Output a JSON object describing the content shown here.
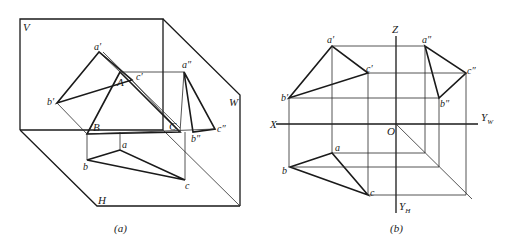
{
  "panel_a": {
    "caption": "(a)",
    "planes": {
      "V": "V",
      "W": "W",
      "H": "H"
    },
    "points": {
      "a_prime": "a′",
      "b_prime": "b′",
      "c_prime": "c′",
      "A": "A",
      "B": "B",
      "C": "C",
      "a_dprime": "a″",
      "b_dprime": "b″",
      "c_dprime": "c″",
      "a": "a",
      "b": "b",
      "c": "c"
    }
  },
  "panel_b": {
    "caption": "(b)",
    "axes": {
      "X": "X",
      "Z": "Z",
      "O": "O",
      "Y": "Y",
      "W_sub": "W",
      "H_sub": "H"
    },
    "points": {
      "a_prime": "a′",
      "b_prime": "b′",
      "c_prime": "c′",
      "a_dprime": "a″",
      "b_dprime": "b″",
      "c_dprime": "c″",
      "a": "a",
      "b": "b",
      "c": "c"
    }
  }
}
